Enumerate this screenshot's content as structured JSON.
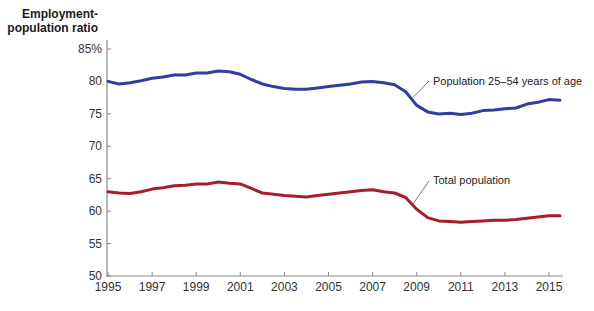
{
  "chart_data": {
    "type": "line",
    "title": "",
    "ylabel": "Employment-population ratio",
    "ylabel_lines": [
      "Employment-",
      "population ratio"
    ],
    "xlabel": "",
    "ylim": [
      50,
      85
    ],
    "xlim": [
      1995,
      2015.6
    ],
    "y_ticks": [
      50,
      55,
      60,
      65,
      70,
      75,
      80,
      85
    ],
    "y_tick_labels": [
      "50",
      "55",
      "60",
      "65",
      "70",
      "75",
      "80",
      "85%"
    ],
    "x_ticks": [
      1995,
      1997,
      1999,
      2001,
      2003,
      2005,
      2007,
      2009,
      2011,
      2013,
      2015
    ],
    "x_tick_labels": [
      "1995",
      "1997",
      "1999",
      "2001",
      "2003",
      "2005",
      "2007",
      "2009",
      "2011",
      "2013",
      "2015"
    ],
    "grid": false,
    "legend": "inline annotations",
    "series": [
      {
        "name": "Population 25–54 years of age",
        "color": "#2e3f9e",
        "x": [
          1995.0,
          1995.5,
          1996.0,
          1996.5,
          1997.0,
          1997.5,
          1998.0,
          1998.5,
          1999.0,
          1999.5,
          2000.0,
          2000.5,
          2001.0,
          2001.5,
          2002.0,
          2002.5,
          2003.0,
          2003.5,
          2004.0,
          2004.5,
          2005.0,
          2005.5,
          2006.0,
          2006.5,
          2007.0,
          2007.5,
          2008.0,
          2008.5,
          2009.0,
          2009.5,
          2010.0,
          2010.5,
          2011.0,
          2011.5,
          2012.0,
          2012.5,
          2013.0,
          2013.5,
          2014.0,
          2014.5,
          2015.0,
          2015.5
        ],
        "values": [
          80.0,
          79.6,
          79.8,
          80.1,
          80.5,
          80.7,
          81.0,
          81.0,
          81.3,
          81.3,
          81.6,
          81.5,
          81.1,
          80.3,
          79.6,
          79.2,
          78.9,
          78.8,
          78.8,
          79.0,
          79.2,
          79.4,
          79.6,
          79.9,
          80.0,
          79.8,
          79.5,
          78.4,
          76.3,
          75.3,
          75.0,
          75.1,
          74.9,
          75.1,
          75.5,
          75.6,
          75.8,
          75.9,
          76.5,
          76.8,
          77.2,
          77.1
        ]
      },
      {
        "name": "Total population",
        "color": "#a51f2a",
        "x": [
          1995.0,
          1995.5,
          1996.0,
          1996.5,
          1997.0,
          1997.5,
          1998.0,
          1998.5,
          1999.0,
          1999.5,
          2000.0,
          2000.5,
          2001.0,
          2001.5,
          2002.0,
          2002.5,
          2003.0,
          2003.5,
          2004.0,
          2004.5,
          2005.0,
          2005.5,
          2006.0,
          2006.5,
          2007.0,
          2007.5,
          2008.0,
          2008.5,
          2009.0,
          2009.5,
          2010.0,
          2010.5,
          2011.0,
          2011.5,
          2012.0,
          2012.5,
          2013.0,
          2013.5,
          2014.0,
          2014.5,
          2015.0,
          2015.5
        ],
        "values": [
          63.0,
          62.8,
          62.7,
          63.0,
          63.4,
          63.6,
          63.9,
          64.0,
          64.2,
          64.2,
          64.5,
          64.3,
          64.2,
          63.5,
          62.8,
          62.6,
          62.4,
          62.3,
          62.2,
          62.4,
          62.6,
          62.8,
          63.0,
          63.2,
          63.3,
          63.0,
          62.8,
          62.1,
          60.3,
          59.0,
          58.5,
          58.4,
          58.3,
          58.4,
          58.5,
          58.6,
          58.6,
          58.7,
          58.9,
          59.1,
          59.3,
          59.3
        ]
      }
    ],
    "annotations": [
      {
        "text": "Population 25–54 years of age",
        "points_to": 2008.8
      },
      {
        "text": "Total population",
        "points_to": 2008.8
      }
    ]
  }
}
